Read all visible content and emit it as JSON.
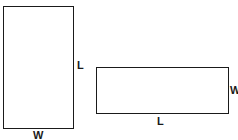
{
  "diagram": {
    "shapes": [
      {
        "id": "tall-rectangle",
        "orientation": "portrait",
        "labels": {
          "side": "L",
          "bottom": "W"
        }
      },
      {
        "id": "wide-rectangle",
        "orientation": "landscape",
        "labels": {
          "side": "W",
          "bottom": "L"
        }
      }
    ],
    "colors": {
      "stroke": "#1a1a1a",
      "background": "#ffffff"
    }
  }
}
